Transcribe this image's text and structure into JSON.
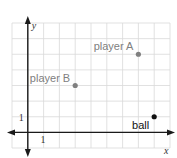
{
  "chart_data": {
    "type": "scatter",
    "title": "",
    "xlabel": "x",
    "ylabel": "y",
    "xlim": [
      -1,
      9
    ],
    "ylim": [
      -1,
      7
    ],
    "grid": true,
    "tick_labels": {
      "x": [
        "1"
      ],
      "y": [
        "1"
      ]
    },
    "points": [
      {
        "name": "player A",
        "x": 7,
        "y": 5,
        "color": "#808080",
        "label_side": "left-above"
      },
      {
        "name": "player B",
        "x": 3,
        "y": 3,
        "color": "#808080",
        "label_side": "left-above"
      },
      {
        "name": "ball",
        "x": 8,
        "y": 1,
        "color": "#111111",
        "label_side": "left-below"
      }
    ],
    "label_colors": {
      "player A": "#808080",
      "player B": "#808080",
      "ball": "#111111"
    }
  }
}
